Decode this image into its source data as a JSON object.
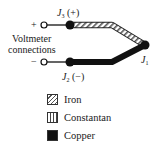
{
  "diagram": {
    "junctions": {
      "j3": {
        "symbol": "J",
        "sub": "3",
        "polarity": "(+)"
      },
      "j2": {
        "symbol": "J",
        "sub": "2",
        "polarity": "(−)"
      },
      "j1": {
        "symbol": "J",
        "sub": "1"
      }
    },
    "terminals": {
      "plus": "+",
      "minus": "−"
    },
    "voltmeter_label": {
      "line1": "Voltmeter",
      "line2": "connections"
    },
    "legend": [
      {
        "label": "Iron",
        "pattern": "diagonal-hatch"
      },
      {
        "label": "Constantan",
        "pattern": "vertical-hatch"
      },
      {
        "label": "Copper",
        "pattern": "solid-black"
      }
    ],
    "colors": {
      "wire": "#111111",
      "background": "#ffffff"
    }
  }
}
